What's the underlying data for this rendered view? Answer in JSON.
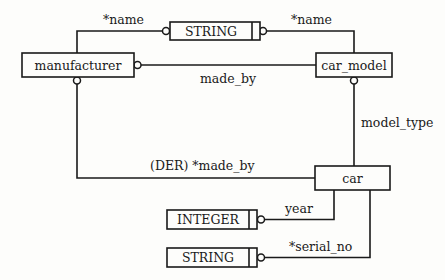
{
  "diagram": {
    "type": "ORM conceptual schema",
    "entities": [
      {
        "id": "manufacturer",
        "label": "manufacturer"
      },
      {
        "id": "car_model",
        "label": "car_model"
      },
      {
        "id": "car",
        "label": "car"
      }
    ],
    "value_types": [
      {
        "id": "string_top",
        "label": "STRING"
      },
      {
        "id": "integer",
        "label": "INTEGER"
      },
      {
        "id": "string_bottom",
        "label": "STRING"
      }
    ],
    "relations": [
      {
        "id": "manufacturer_name",
        "label": "*name",
        "from": "manufacturer",
        "to": "string_top"
      },
      {
        "id": "car_model_name",
        "label": "*name",
        "from": "car_model",
        "to": "string_top"
      },
      {
        "id": "made_by",
        "label": "made_by",
        "from": "car_model",
        "to": "manufacturer"
      },
      {
        "id": "model_type",
        "label": "model_type",
        "from": "car",
        "to": "car_model"
      },
      {
        "id": "der_made_by",
        "label": "(DER) *made_by",
        "from": "car",
        "to": "manufacturer"
      },
      {
        "id": "year",
        "label": "year",
        "from": "car",
        "to": "integer"
      },
      {
        "id": "serial_no",
        "label": "*serial_no",
        "from": "car",
        "to": "string_bottom"
      }
    ]
  }
}
